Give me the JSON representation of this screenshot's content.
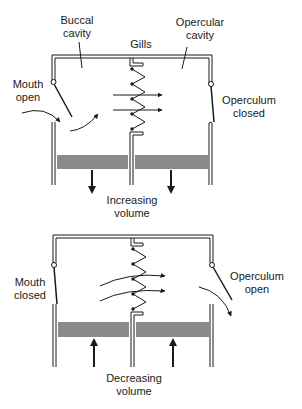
{
  "diagram": {
    "type": "fish-respiration-pump",
    "colors": {
      "line": "#1a1a1a",
      "piston": "#8a8a8a",
      "background": "#ffffff"
    },
    "top_panel": {
      "labels": {
        "buccal_cavity": [
          "Buccal",
          "cavity"
        ],
        "opercular_cavity": [
          "Opercular",
          "cavity"
        ],
        "gills": "Gills",
        "mouth": [
          "Mouth",
          "open"
        ],
        "operculum": [
          "Operculum",
          "closed"
        ],
        "volume": [
          "Increasing",
          "volume"
        ]
      },
      "piston_direction": "down"
    },
    "bottom_panel": {
      "labels": {
        "mouth": [
          "Mouth",
          "closed"
        ],
        "operculum": [
          "Operculum",
          "open"
        ],
        "volume": [
          "Decreasing",
          "volume"
        ]
      },
      "piston_direction": "up"
    }
  }
}
